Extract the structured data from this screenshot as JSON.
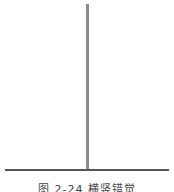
{
  "figure": {
    "caption_number": "图 2-24",
    "caption_title": "横竖错觉",
    "caption": "图 2-24  横竖错觉",
    "vertical_line": {
      "color": "#8a8a8a",
      "x": 87,
      "y_start": 4,
      "y_end": 170
    },
    "horizontal_line": {
      "color": "#555555",
      "y": 170,
      "x_start": 5,
      "x_end": 169
    }
  }
}
